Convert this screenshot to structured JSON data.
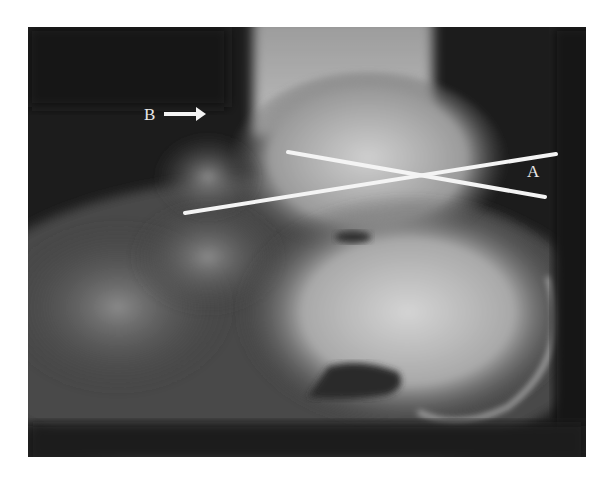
{
  "figure": {
    "type": "lateral foot radiograph",
    "labels": {
      "a": "A",
      "b": "B"
    },
    "annotations": [
      {
        "kind": "line",
        "name": "axis-line-1",
        "from": [
          185,
          213
        ],
        "to": [
          556,
          154
        ]
      },
      {
        "kind": "line",
        "name": "axis-line-2",
        "from": [
          288,
          152
        ],
        "to": [
          545,
          197
        ]
      },
      {
        "kind": "arrow",
        "name": "arrow-b",
        "from": [
          164,
          114
        ],
        "to": [
          205,
          114
        ],
        "direction": "right"
      }
    ],
    "colors": {
      "background": "#ffffff",
      "film_dark": "#1a1a1a",
      "bone_light": "#d8d8d8",
      "annotation": "#f4f4f4"
    }
  }
}
